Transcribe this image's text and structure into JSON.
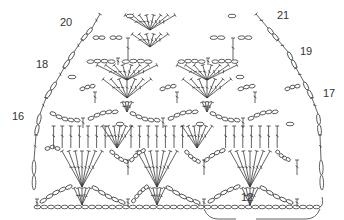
{
  "diagram": {
    "type": "crochet-stitch-chart",
    "ink_color": "#3a3a3a",
    "background": "#ffffff",
    "row_labels": [
      {
        "text": "20",
        "x": 60,
        "y": 23
      },
      {
        "text": "21",
        "x": 277,
        "y": 16
      },
      {
        "text": "19",
        "x": 300,
        "y": 52
      },
      {
        "text": "18",
        "x": 36,
        "y": 65
      },
      {
        "text": "17",
        "x": 323,
        "y": 93
      },
      {
        "text": "16",
        "x": 12,
        "y": 117
      }
    ],
    "repeat_label": {
      "text": "12",
      "x": 245,
      "y": 199
    },
    "foundation_chain": {
      "y": 207,
      "x_start": 34,
      "x_end": 320,
      "count": 42
    },
    "rows": [
      {
        "row": 15,
        "y": 188,
        "fans": [
          82,
          157,
          250
        ],
        "fan_top": 175,
        "single_dc": [
          37,
          128,
          204,
          297
        ]
      },
      {
        "row": 14,
        "y": 150,
        "fans": [
          82,
          157,
          250
        ]
      },
      {
        "row": 13,
        "y": 128,
        "fans": [
          82,
          157,
          250
        ]
      },
      {
        "row": 17,
        "y": 103,
        "fans": [
          127,
          207
        ]
      },
      {
        "row": 18,
        "y": 80,
        "fans": [
          107,
          236
        ]
      },
      {
        "row": 19,
        "y": 62,
        "fans": [
          127,
          207
        ]
      },
      {
        "row": 20,
        "y": 35,
        "fans": [
          150,
          172
        ]
      },
      {
        "row": 21,
        "y": 17,
        "fans": [
          160
        ]
      }
    ]
  }
}
